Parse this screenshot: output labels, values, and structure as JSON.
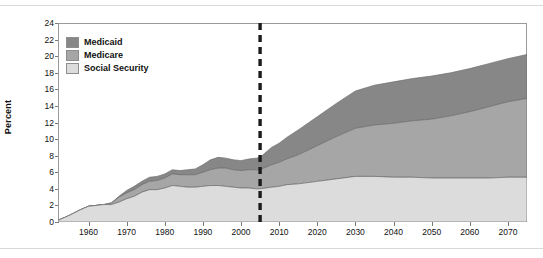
{
  "chart_data": {
    "type": "area",
    "title": "",
    "subtitle": "",
    "xlabel": "",
    "ylabel": "Percent",
    "xlim": [
      1952,
      2075
    ],
    "ylim": [
      0,
      24
    ],
    "ytick_step": 2,
    "grid": false,
    "stacked": true,
    "legend_position": "upper-left",
    "yticks": [
      0,
      2,
      4,
      6,
      8,
      10,
      12,
      14,
      16,
      18,
      20,
      22,
      24
    ],
    "xticks": [
      1960,
      1970,
      1980,
      1990,
      2000,
      2010,
      2020,
      2030,
      2040,
      2050,
      2060,
      2070
    ],
    "annotations": [
      {
        "name": "projection-divider",
        "type": "vline",
        "x": 2005,
        "style": "dashed",
        "color": "#1b1b1b"
      }
    ],
    "series": [
      {
        "name": "Social Security",
        "color": "#dcdcdc",
        "x": [
          1952,
          1955,
          1958,
          1960,
          1962,
          1964,
          1966,
          1968,
          1970,
          1972,
          1974,
          1976,
          1978,
          1980,
          1982,
          1984,
          1986,
          1988,
          1990,
          1992,
          1994,
          1996,
          1998,
          2000,
          2002,
          2004,
          2005,
          2008,
          2010,
          2012,
          2015,
          2020,
          2025,
          2030,
          2035,
          2040,
          2045,
          2050,
          2055,
          2060,
          2065,
          2070,
          2075
        ],
        "values": [
          0.2,
          0.8,
          1.5,
          1.9,
          2.0,
          2.1,
          2.1,
          2.4,
          2.8,
          3.1,
          3.6,
          3.9,
          3.9,
          4.1,
          4.4,
          4.3,
          4.2,
          4.2,
          4.3,
          4.4,
          4.4,
          4.3,
          4.2,
          4.1,
          4.1,
          4.0,
          4.0,
          4.2,
          4.3,
          4.5,
          4.6,
          4.9,
          5.2,
          5.5,
          5.5,
          5.4,
          5.4,
          5.3,
          5.3,
          5.3,
          5.3,
          5.4,
          5.4
        ]
      },
      {
        "name": "Medicare",
        "color": "#a6a6a6",
        "x": [
          1952,
          1955,
          1958,
          1960,
          1962,
          1964,
          1966,
          1968,
          1970,
          1972,
          1974,
          1976,
          1978,
          1980,
          1982,
          1984,
          1986,
          1988,
          1990,
          1992,
          1994,
          1996,
          1998,
          2000,
          2002,
          2004,
          2005,
          2008,
          2010,
          2012,
          2015,
          2020,
          2025,
          2030,
          2035,
          2040,
          2045,
          2050,
          2055,
          2060,
          2065,
          2070,
          2075
        ],
        "values": [
          0.0,
          0.0,
          0.0,
          0.0,
          0.0,
          0.0,
          0.2,
          0.6,
          0.7,
          0.8,
          0.9,
          1.0,
          1.1,
          1.2,
          1.4,
          1.4,
          1.5,
          1.5,
          1.7,
          1.9,
          2.1,
          2.2,
          2.1,
          2.1,
          2.2,
          2.3,
          2.3,
          2.7,
          2.9,
          3.1,
          3.5,
          4.3,
          5.1,
          5.8,
          6.2,
          6.5,
          6.8,
          7.1,
          7.5,
          8.0,
          8.6,
          9.1,
          9.5
        ]
      },
      {
        "name": "Medicaid",
        "color": "#878787",
        "x": [
          1952,
          1955,
          1958,
          1960,
          1962,
          1964,
          1966,
          1968,
          1970,
          1972,
          1974,
          1976,
          1978,
          1980,
          1982,
          1984,
          1986,
          1988,
          1990,
          1992,
          1994,
          1996,
          1998,
          2000,
          2002,
          2004,
          2005,
          2008,
          2010,
          2012,
          2015,
          2020,
          2025,
          2030,
          2035,
          2040,
          2045,
          2050,
          2055,
          2060,
          2065,
          2070,
          2075
        ],
        "values": [
          0.0,
          0.0,
          0.0,
          0.0,
          0.0,
          0.0,
          0.0,
          0.1,
          0.3,
          0.4,
          0.4,
          0.5,
          0.5,
          0.5,
          0.5,
          0.5,
          0.6,
          0.7,
          0.9,
          1.2,
          1.3,
          1.2,
          1.2,
          1.2,
          1.3,
          1.4,
          1.5,
          2.1,
          2.3,
          2.6,
          3.0,
          3.5,
          4.0,
          4.5,
          4.8,
          5.0,
          5.1,
          5.2,
          5.2,
          5.2,
          5.2,
          5.2,
          5.3
        ]
      }
    ]
  },
  "legend": {
    "items": [
      {
        "label": "Medicaid",
        "color": "#878787"
      },
      {
        "label": "Medicare",
        "color": "#a6a6a6"
      },
      {
        "label": "Social Security",
        "color": "#dcdcdc"
      }
    ]
  },
  "axis": {
    "y_title": "Percent"
  }
}
